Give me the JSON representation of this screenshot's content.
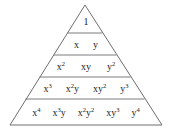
{
  "diagram": {
    "shape": "triangle",
    "background_color": "#ffffff",
    "line_color": "#6e6e6e",
    "text_color": "#1c1c1c",
    "apex": {
      "x": 85,
      "y": 5
    },
    "base": {
      "left_x": 10,
      "right_x": 162,
      "y": 125
    },
    "dividers_y": [
      33,
      55,
      77,
      99
    ],
    "rows": [
      {
        "index": 0,
        "power": 0,
        "terms": [
          {
            "base": "1",
            "exponent": ""
          }
        ]
      },
      {
        "index": 1,
        "power": 1,
        "terms": [
          {
            "base": "x",
            "exponent": ""
          },
          {
            "base": "y",
            "exponent": ""
          }
        ]
      },
      {
        "index": 2,
        "power": 2,
        "terms": [
          {
            "base": "x",
            "exponent": "2"
          },
          {
            "base": "xy",
            "exponent": ""
          },
          {
            "base": "y",
            "exponent": "2"
          }
        ]
      },
      {
        "index": 3,
        "power": 3,
        "terms": [
          {
            "base": "x",
            "exponent": "3"
          },
          {
            "base": "x",
            "exponent": "2",
            "suffix": "y"
          },
          {
            "base": "xy",
            "exponent": "2"
          },
          {
            "base": "y",
            "exponent": "3"
          }
        ]
      },
      {
        "index": 4,
        "power": 4,
        "terms": [
          {
            "base": "x",
            "exponent": "4"
          },
          {
            "base": "x",
            "exponent": "3",
            "suffix": "y"
          },
          {
            "base": "x",
            "exponent": "2",
            "suffix": "y",
            "suffix_exponent": "2"
          },
          {
            "base": "xy",
            "exponent": "3"
          },
          {
            "base": "y",
            "exponent": "4"
          }
        ]
      }
    ],
    "row_text": {
      "row1": [
        "1"
      ],
      "row2": [
        "x",
        "y"
      ],
      "row3": [
        "x²",
        "xy",
        "y²"
      ],
      "row4": [
        "x³",
        "x²y",
        "xy²",
        "y³"
      ],
      "row5": [
        "x⁴",
        "x³y",
        "x²y²",
        "xy³",
        "y⁴"
      ]
    }
  }
}
